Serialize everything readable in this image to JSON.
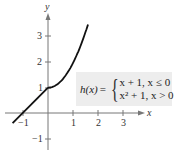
{
  "chart_data": {
    "type": "line",
    "title": "",
    "function_name": "h(x)",
    "pieces": [
      {
        "expr": "x + 1",
        "condition": "x ≤ 0",
        "domain": [
          -1.4,
          0
        ]
      },
      {
        "expr": "x² + 1",
        "condition": "x > 0",
        "domain": [
          0,
          1.58
        ]
      }
    ],
    "series": [
      {
        "name": "h(x)",
        "x": [
          -1.4,
          -1,
          0,
          0.5,
          1,
          1.5,
          1.58
        ],
        "y": [
          -0.4,
          0,
          1,
          1.25,
          2,
          3.25,
          3.5
        ]
      }
    ],
    "xlabel": "x",
    "ylabel": "y",
    "x_ticks": [
      -1,
      1,
      2,
      3
    ],
    "y_ticks": [
      -1,
      1,
      2,
      3
    ],
    "xlim": [
      -1.9,
      3.8
    ],
    "ylim": [
      -1.5,
      4.3
    ],
    "grid": false,
    "legend": "none",
    "line_color": "#111111",
    "axis_color": "#777777",
    "formula_bg": "#ededed"
  },
  "formula": {
    "lhs": "h(x)",
    "eq": "=",
    "brace": "{",
    "case1": "x + 1,  x ≤ 0",
    "case2": "x² + 1, x > 0"
  },
  "labels": {
    "x_axis": "x",
    "y_axis": "y",
    "xt_m1": "−1",
    "xt_1": "1",
    "xt_2": "2",
    "xt_3": "3",
    "yt_m1": "−1",
    "yt_1": "1",
    "yt_2": "2",
    "yt_3": "3"
  }
}
